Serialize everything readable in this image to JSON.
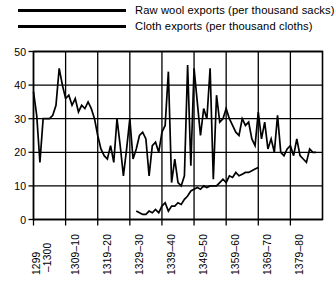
{
  "legend": {
    "items": [
      {
        "label": "Raw wool exports (per thousand sacks)",
        "key": "raw_wool"
      },
      {
        "label": "Cloth exports (per thousand cloths)",
        "key": "cloth"
      }
    ]
  },
  "axes": {
    "y_ticks": [
      "0",
      "10",
      "20",
      "30",
      "40",
      "50"
    ],
    "x_ticks": [
      "1299– 1300",
      "1309–10",
      "1319–20",
      "1329–30",
      "1339–40",
      "1349–50",
      "1359–60",
      "1369–70",
      "1379–80"
    ],
    "x_tick_first_line": "1299",
    "x_tick_first_line2": "–1300"
  },
  "colors": {
    "line": "#000000",
    "grid": "#000000",
    "background": "#ffffff"
  },
  "chart_data": {
    "type": "line",
    "title": "",
    "xlabel": "",
    "ylabel": "",
    "ylim": [
      0,
      50
    ],
    "xlim": [
      1295,
      1385
    ],
    "grid": true,
    "legend_position": "top",
    "x_tick_values": [
      1295,
      1305,
      1315,
      1325,
      1335,
      1345,
      1355,
      1365,
      1375
    ],
    "x_tick_labels": [
      "1299–1300",
      "1309–10",
      "1319–20",
      "1329–30",
      "1339–40",
      "1349–50",
      "1359–60",
      "1369–70",
      "1379–80"
    ],
    "y_tick_values": [
      0,
      10,
      20,
      30,
      40,
      50
    ],
    "series": [
      {
        "name": "Raw wool exports (per thousand sacks)",
        "unit": "thousand sacks",
        "x": [
          1295,
          1296,
          1297,
          1298,
          1299,
          1300,
          1301,
          1302,
          1303,
          1304,
          1305,
          1306,
          1307,
          1308,
          1309,
          1310,
          1311,
          1312,
          1313,
          1314,
          1315,
          1316,
          1317,
          1318,
          1319,
          1320,
          1321,
          1322,
          1323,
          1324,
          1325,
          1326,
          1327,
          1328,
          1329,
          1330,
          1331,
          1332,
          1333,
          1334,
          1335,
          1336,
          1337,
          1338,
          1339,
          1340,
          1341,
          1342,
          1343,
          1344,
          1345,
          1346,
          1347,
          1348,
          1349,
          1350,
          1351,
          1352,
          1353,
          1354,
          1355,
          1356,
          1357,
          1358,
          1359,
          1360,
          1361,
          1362,
          1363,
          1364,
          1365,
          1366,
          1367,
          1368,
          1369,
          1370,
          1371,
          1372,
          1373,
          1374,
          1375,
          1376,
          1377,
          1378,
          1379,
          1380,
          1381,
          1382,
          1383
        ],
        "values": [
          38,
          31,
          17,
          30,
          30,
          30,
          31,
          34,
          45,
          40,
          36,
          37,
          34,
          36,
          32,
          34,
          33,
          35,
          33,
          30,
          25,
          21,
          19,
          18,
          22,
          17,
          30,
          22,
          13,
          21,
          30,
          18,
          21,
          25,
          26,
          24,
          13,
          22,
          23,
          20,
          26,
          28,
          44,
          11,
          18,
          11,
          10,
          13,
          46,
          16,
          45,
          35,
          25,
          33,
          30,
          45,
          12,
          37,
          29,
          30,
          33,
          30,
          28,
          26,
          25,
          30,
          28,
          29,
          24,
          22,
          32,
          24,
          29,
          21,
          24,
          20,
          31,
          20,
          19,
          21,
          22,
          19,
          24,
          19,
          18,
          17,
          21,
          20,
          20
        ]
      },
      {
        "name": "Cloth exports (per thousand cloths)",
        "unit": "thousand cloths",
        "x": [
          1327,
          1328,
          1329,
          1330,
          1331,
          1332,
          1333,
          1334,
          1335,
          1336,
          1337,
          1338,
          1339,
          1340,
          1341,
          1342,
          1343,
          1344,
          1345,
          1346,
          1347,
          1348,
          1349,
          1350,
          1351,
          1352,
          1353,
          1354,
          1355,
          1356,
          1357,
          1358,
          1359,
          1360,
          1361,
          1362,
          1363,
          1364,
          1365
        ],
        "values": [
          2.5,
          2.0,
          1.5,
          1.5,
          2.5,
          2.0,
          3.0,
          2.0,
          4.0,
          5.0,
          2.5,
          4.0,
          4.0,
          5.0,
          4.5,
          6.0,
          7.0,
          8.5,
          9.0,
          9.5,
          9.0,
          10.0,
          9.5,
          10.0,
          10.0,
          10.0,
          11.0,
          12.0,
          11.0,
          13.0,
          12.5,
          14.0,
          13.0,
          13.5,
          14.0,
          14.0,
          14.5,
          15.0,
          15.5
        ]
      }
    ]
  }
}
